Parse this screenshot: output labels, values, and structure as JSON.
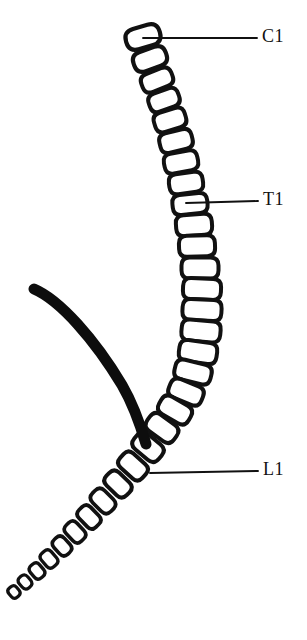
{
  "figure": {
    "name": "vertebral-column-lateral-diagram",
    "background_color": "#ffffff",
    "ink_color": "#111111",
    "width": 307,
    "height": 640
  },
  "labels": [
    {
      "id": "c1",
      "text": "C1",
      "text_x": 262,
      "text_y": 38,
      "leader_x1": 143,
      "leader_y1": 38,
      "leader_x2": 257,
      "leader_y2": 38
    },
    {
      "id": "t1",
      "text": "T1",
      "text_x": 263,
      "text_y": 201,
      "leader_x1": 186,
      "leader_y1": 203,
      "leader_x2": 258,
      "leader_y2": 201
    },
    {
      "id": "l1",
      "text": "L1",
      "text_x": 263,
      "text_y": 471,
      "leader_x1": 150,
      "leader_y1": 473,
      "leader_x2": 258,
      "leader_y2": 471
    }
  ],
  "rib": {
    "id": "rib-arc",
    "path": "M 34 289 C 60 300 95 340 122 385 C 133 404 141 427 146 444",
    "stroke_width": 11,
    "color": "#0d0d0d"
  },
  "vertebrae": [
    {
      "id": "v-c1",
      "cx": 143,
      "cy": 37,
      "rx": 17.5,
      "ry": 10.5,
      "rot": -16,
      "round": 10,
      "sw": 4.2
    },
    {
      "id": "v-c2",
      "cx": 150,
      "cy": 59,
      "rx": 17.0,
      "ry": 10.0,
      "rot": -20,
      "round": 9,
      "sw": 4.2
    },
    {
      "id": "v-c3",
      "cx": 157,
      "cy": 80,
      "rx": 16.0,
      "ry": 9.5,
      "rot": -22,
      "round": 8,
      "sw": 4.0
    },
    {
      "id": "v-c4",
      "cx": 164,
      "cy": 100,
      "rx": 15.5,
      "ry": 9.5,
      "rot": -20,
      "round": 8,
      "sw": 4.0
    },
    {
      "id": "v-c5",
      "cx": 170,
      "cy": 120,
      "rx": 16.0,
      "ry": 10.0,
      "rot": -17,
      "round": 8,
      "sw": 4.0
    },
    {
      "id": "v-c6",
      "cx": 176,
      "cy": 141,
      "rx": 16.5,
      "ry": 10.0,
      "rot": -14,
      "round": 8,
      "sw": 4.0
    },
    {
      "id": "v-c7",
      "cx": 181,
      "cy": 162,
      "rx": 17.0,
      "ry": 10.0,
      "rot": -11,
      "round": 8,
      "sw": 4.0
    },
    {
      "id": "v-t1",
      "cx": 186,
      "cy": 183,
      "rx": 17.0,
      "ry": 10.0,
      "rot": -8,
      "round": 8,
      "sw": 4.0
    },
    {
      "id": "v-t2",
      "cx": 190,
      "cy": 204,
      "rx": 17.5,
      "ry": 10.0,
      "rot": -6,
      "round": 8,
      "sw": 4.0
    },
    {
      "id": "v-t3",
      "cx": 194,
      "cy": 225,
      "rx": 18.0,
      "ry": 10.5,
      "rot": -4,
      "round": 8,
      "sw": 4.0
    },
    {
      "id": "v-t4",
      "cx": 197,
      "cy": 246,
      "rx": 18.0,
      "ry": 10.5,
      "rot": -2,
      "round": 8,
      "sw": 4.0
    },
    {
      "id": "v-t5",
      "cx": 200,
      "cy": 268,
      "rx": 18.5,
      "ry": 10.5,
      "rot": 0,
      "round": 8,
      "sw": 4.0
    },
    {
      "id": "v-t6",
      "cx": 202,
      "cy": 289,
      "rx": 19.0,
      "ry": 10.5,
      "rot": 2,
      "round": 8,
      "sw": 4.0
    },
    {
      "id": "v-t7",
      "cx": 202,
      "cy": 310,
      "rx": 19.5,
      "ry": 10.5,
      "rot": 3,
      "round": 8,
      "sw": 4.0
    },
    {
      "id": "v-t8",
      "cx": 201,
      "cy": 331,
      "rx": 19.5,
      "ry": 10.5,
      "rot": 5,
      "round": 8,
      "sw": 4.0
    },
    {
      "id": "v-t9",
      "cx": 198,
      "cy": 352,
      "rx": 19.0,
      "ry": 10.5,
      "rot": 8,
      "round": 8,
      "sw": 4.0
    },
    {
      "id": "v-t10",
      "cx": 193,
      "cy": 372,
      "rx": 18.5,
      "ry": 10.0,
      "rot": 14,
      "round": 8,
      "sw": 4.0
    },
    {
      "id": "v-t11",
      "cx": 186,
      "cy": 392,
      "rx": 17.5,
      "ry": 10.0,
      "rot": 22,
      "round": 8,
      "sw": 4.0
    },
    {
      "id": "v-t12",
      "cx": 175,
      "cy": 410,
      "rx": 17.0,
      "ry": 10.0,
      "rot": 30,
      "round": 8,
      "sw": 4.0
    },
    {
      "id": "v-l1",
      "cx": 162,
      "cy": 428,
      "rx": 16.5,
      "ry": 10.0,
      "rot": 36,
      "round": 8,
      "sw": 4.0
    },
    {
      "id": "v-l2",
      "cx": 148,
      "cy": 447,
      "rx": 16.0,
      "ry": 10.0,
      "rot": 40,
      "round": 8,
      "sw": 4.0
    },
    {
      "id": "v-l3",
      "cx": 133,
      "cy": 466,
      "rx": 15.0,
      "ry": 9.5,
      "rot": 42,
      "round": 7,
      "sw": 4.0
    },
    {
      "id": "v-l4",
      "cx": 118,
      "cy": 484,
      "rx": 14.0,
      "ry": 9.0,
      "rot": 44,
      "round": 7,
      "sw": 4.0
    },
    {
      "id": "v-l5",
      "cx": 103,
      "cy": 501,
      "rx": 13.0,
      "ry": 8.5,
      "rot": 45,
      "round": 7,
      "sw": 3.8
    },
    {
      "id": "v-s1",
      "cx": 89,
      "cy": 517,
      "rx": 12.0,
      "ry": 8.0,
      "rot": 46,
      "round": 6,
      "sw": 3.8
    },
    {
      "id": "v-s2",
      "cx": 75,
      "cy": 532,
      "rx": 11.0,
      "ry": 7.5,
      "rot": 47,
      "round": 6,
      "sw": 3.6
    },
    {
      "id": "v-s3",
      "cx": 62,
      "cy": 546,
      "rx": 10.0,
      "ry": 7.0,
      "rot": 48,
      "round": 6,
      "sw": 3.6
    },
    {
      "id": "v-s4",
      "cx": 49,
      "cy": 559,
      "rx": 9.0,
      "ry": 6.5,
      "rot": 49,
      "round": 5,
      "sw": 3.4
    },
    {
      "id": "v-co1",
      "cx": 37,
      "cy": 571,
      "rx": 8.0,
      "ry": 6.0,
      "rot": 50,
      "round": 5,
      "sw": 3.4
    },
    {
      "id": "v-co2",
      "cx": 25,
      "cy": 582,
      "rx": 7.0,
      "ry": 5.5,
      "rot": 50,
      "round": 5,
      "sw": 3.2
    },
    {
      "id": "v-co3",
      "cx": 14,
      "cy": 592,
      "rx": 6.0,
      "ry": 5.0,
      "rot": 50,
      "round": 4,
      "sw": 3.2
    }
  ]
}
